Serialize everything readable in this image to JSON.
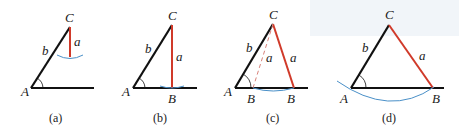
{
  "colors": {
    "black_side": "#111111",
    "red_side": "#d03a2a",
    "arc": "#4a90c8",
    "background_panel": "#f1f5f9"
  },
  "panels": [
    {
      "caption": "(a)",
      "labels": {
        "A": "A",
        "b": "b",
        "C": "C",
        "a": "a"
      }
    },
    {
      "caption": "(b)",
      "labels": {
        "A": "A",
        "b": "b",
        "C": "C",
        "a": "a",
        "B": "B"
      }
    },
    {
      "caption": "(c)",
      "labels": {
        "A": "A",
        "b": "b",
        "C": "C",
        "a1": "a",
        "a2": "a",
        "B1": "B",
        "B2": "B"
      }
    },
    {
      "caption": "(d)",
      "labels": {
        "A": "A",
        "b": "b",
        "C": "C",
        "a": "a",
        "B": "B"
      }
    }
  ]
}
